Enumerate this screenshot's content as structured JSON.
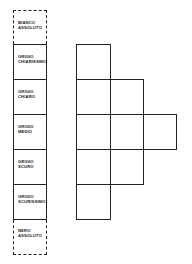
{
  "scale": {
    "items": [
      {
        "line1": "BIANCO",
        "line2": "ASSOLUTO",
        "style": "dashed"
      },
      {
        "line1": "GRIGIO",
        "line2": "CHIARISSIMO",
        "style": "solid"
      },
      {
        "line1": "GRIGIO",
        "line2": "CHIARO",
        "style": "solid"
      },
      {
        "line1": "GRIGIO",
        "line2": "MEDIO",
        "style": "solid"
      },
      {
        "line1": "GRIGIO",
        "line2": "SCURO",
        "style": "solid"
      },
      {
        "line1": "GRIGIO",
        "line2": "SCURISSIMO",
        "style": "solid"
      },
      {
        "line1": "NERO",
        "line2": "ASSOLUTO",
        "style": "dashed"
      }
    ]
  },
  "grid": {
    "rows": [
      {
        "cells": 1
      },
      {
        "cells": 2
      },
      {
        "cells": 3
      },
      {
        "cells": 2
      },
      {
        "cells": 1
      }
    ]
  }
}
